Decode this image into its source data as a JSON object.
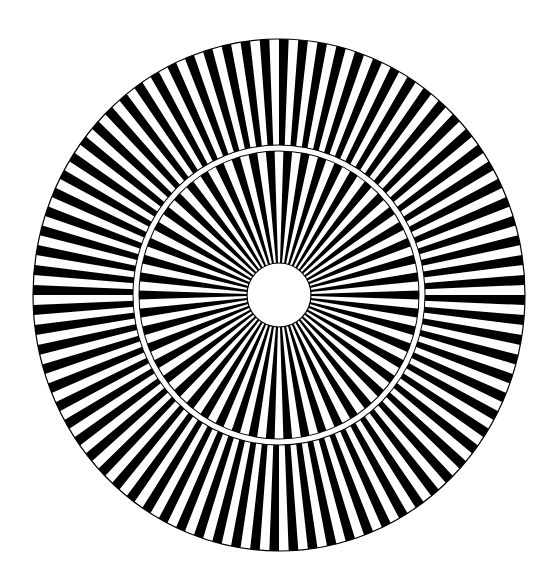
{
  "figure": {
    "type": "radial-spoke-pattern",
    "width": 557,
    "height": 583,
    "background": "#ffffff",
    "center": {
      "x": 279,
      "y": 295
    },
    "outer_ring": {
      "rx": 246,
      "ry": 256,
      "inner_rx": 145,
      "inner_ry": 149,
      "spoke_pairs": 80,
      "fill": "#000000",
      "gap_fill": "#ffffff",
      "rotation_deg": 0
    },
    "separator_ring": {
      "rx": 143,
      "ry": 147,
      "stroke_width": 5,
      "color": "#ffffff",
      "outline": "#000000"
    },
    "inner_ring": {
      "rx": 141,
      "ry": 145,
      "inner_r": 32,
      "spoke_pairs": 50,
      "fill": "#000000",
      "gap_fill": "#ffffff",
      "rotation_deg": 1.8
    },
    "center_hole": {
      "r": 32,
      "fill": "#ffffff",
      "outline": "#000000"
    },
    "outline_color": "#000000",
    "outline_width": 1.2
  }
}
